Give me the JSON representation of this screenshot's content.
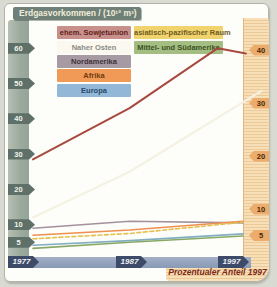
{
  "header": {
    "title": "Erdgasvorkommen / (10¹² m³)"
  },
  "right_axis_title": "Prozentualer Anteil 1997",
  "legend": {
    "items": [
      {
        "key": "sowjetunion",
        "label": "ehem. Sowjetunion",
        "color": "#c8908a",
        "text_color": "#5f211c"
      },
      {
        "key": "asien-pazifik",
        "label": "asiatisch-pazifischer Raum",
        "color": "#f1d36e",
        "text_color": "#6e5c1e"
      },
      {
        "key": "naher-osten",
        "label": "Naher Osten",
        "color": "#faf8ef",
        "text_color": "#8b8b85"
      },
      {
        "key": "mittel-sued",
        "label": "Mittel- und Südamerika",
        "color": "#a3bd82",
        "text_color": "#3c5224"
      },
      {
        "key": "nordamerika",
        "label": "Nordamerika",
        "color": "#a79aa2",
        "text_color": "#3f333b"
      },
      {
        "key": "afrika",
        "label": "Afrika",
        "color": "#f19a58",
        "text_color": "#6e3c10"
      },
      {
        "key": "europa",
        "label": "Europa",
        "color": "#93b7d7",
        "text_color": "#27496b"
      }
    ]
  },
  "chart_data": {
    "type": "line",
    "title": "Erdgasvorkommen / (10¹² m³)",
    "x_years": [
      "1977",
      "1987",
      "1997"
    ],
    "left_axis": {
      "label": "Erdgasvorkommen (10¹² m³)",
      "ticks": [
        60,
        50,
        40,
        30,
        20,
        10,
        5
      ],
      "range": [
        0,
        65
      ]
    },
    "right_axis": {
      "label": "Prozentualer Anteil 1997",
      "ticks": [
        40,
        30,
        20,
        10,
        5
      ],
      "range": [
        0,
        45
      ]
    },
    "grid": false,
    "legend_position": "top-left",
    "series": [
      {
        "key": "naher-osten",
        "name": "Naher Osten",
        "color": "#f5f1e3",
        "dashed": false,
        "width": 2.2,
        "values": [
          12,
          25,
          48
        ],
        "share_1997_pct": 33,
        "points": [
          [
            0,
            12
          ],
          [
            0.46,
            25
          ],
          [
            1.09,
            48
          ]
        ]
      },
      {
        "key": "sowjetunion",
        "name": "ehem. Sowjetunion",
        "color": "#a8493f",
        "dashed": false,
        "width": 2,
        "values": [
          28.5,
          43,
          58.5
        ],
        "share_1997_pct": 40,
        "points": [
          [
            0,
            28.5
          ],
          [
            0.46,
            43
          ],
          [
            0.88,
            60
          ],
          [
            1.014,
            58.5
          ]
        ]
      },
      {
        "key": "nordamerika",
        "name": "Nordamerika",
        "color": "#a2929c",
        "dashed": false,
        "width": 1.6,
        "values": [
          9,
          11,
          10.5
        ],
        "share_1997_pct": 7,
        "points": [
          [
            0,
            9
          ],
          [
            0.46,
            11
          ],
          [
            1,
            10.5
          ]
        ]
      },
      {
        "key": "afrika",
        "name": "Afrika",
        "color": "#ee9050",
        "dashed": false,
        "width": 1.6,
        "values": [
          7,
          8.5,
          11
        ],
        "share_1997_pct": 8,
        "points": [
          [
            0,
            7
          ],
          [
            0.46,
            8.5
          ],
          [
            1,
            11
          ]
        ]
      },
      {
        "key": "asien-pazifik",
        "name": "asiatisch-pazifischer Raum",
        "color": "#e3c050",
        "dashed": true,
        "width": 1.6,
        "values": [
          6,
          7.5,
          10.7
        ],
        "share_1997_pct": 7.5,
        "points": [
          [
            0,
            6
          ],
          [
            0.46,
            7.5
          ],
          [
            1,
            10.7
          ]
        ]
      },
      {
        "key": "europa",
        "name": "Europa",
        "color": "#82aec2",
        "dashed": false,
        "width": 1.6,
        "values": [
          4.2,
          5.5,
          7.4
        ],
        "share_1997_pct": 5,
        "points": [
          [
            0,
            4.2
          ],
          [
            0.46,
            5.5
          ],
          [
            1,
            7.4
          ]
        ]
      },
      {
        "key": "mittel-sued",
        "name": "Mittel- und Südamerika",
        "color": "#8aa966",
        "dashed": false,
        "width": 1.6,
        "values": [
          3.3,
          5,
          6.8
        ],
        "share_1997_pct": 4.5,
        "points": [
          [
            0,
            3.3
          ],
          [
            0.46,
            5
          ],
          [
            1,
            6.8
          ]
        ]
      }
    ]
  }
}
